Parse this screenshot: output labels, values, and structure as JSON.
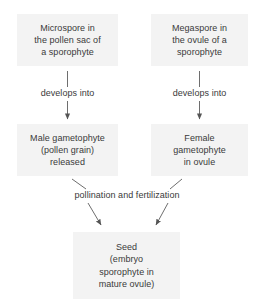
{
  "diagram": {
    "background_color": "#ffffff",
    "node_fill_color": "#f3f3f3",
    "text_color": "#3a3a3a",
    "edge_color": "#6e6e6e",
    "nodes": [
      {
        "id": "microspore",
        "lines": [
          "Microspore in",
          "the pollen sac of",
          "a sporophyte"
        ]
      },
      {
        "id": "megaspore",
        "lines": [
          "Megaspore in",
          "the ovule of a",
          "sporophyte"
        ]
      },
      {
        "id": "male_gametophyte",
        "lines": [
          "Male gametophyte",
          "(pollen grain)",
          "released"
        ]
      },
      {
        "id": "female_gametophyte",
        "lines": [
          "Female",
          "gametophyte",
          "in ovule"
        ]
      },
      {
        "id": "seed",
        "lines": [
          "Seed",
          "(embryo",
          "sporophyte in",
          "mature ovule)"
        ]
      }
    ],
    "edge_labels": {
      "develops_into_left": "develops into",
      "develops_into_right": "develops into",
      "pollination": "pollination and fertilization"
    }
  }
}
